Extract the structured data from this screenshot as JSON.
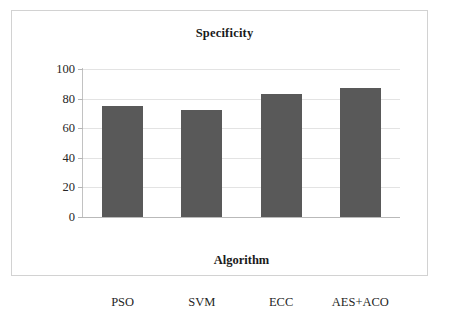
{
  "chart_data": {
    "type": "bar",
    "title": "Specificity",
    "xlabel": "Algorithm",
    "ylabel": "Percentage",
    "categories": [
      "PSO",
      "SVM",
      "ECC",
      "AES+ACO"
    ],
    "values": [
      75,
      72,
      83,
      87
    ],
    "ylim": [
      0,
      100
    ],
    "yticks": [
      0,
      20,
      40,
      60,
      80,
      100
    ],
    "ytick_labels": [
      "0",
      "20",
      "40",
      "60",
      "80",
      "100"
    ],
    "grid": true,
    "legend": false,
    "bar_color": "#595959",
    "gridline_color": "#e3e3e3",
    "axis_color": "#b9b9b9",
    "frame_color": "#d2d2d2",
    "background_color": "#ffffff",
    "series": [
      {
        "name": "Specificity",
        "values": [
          75,
          72,
          83,
          87
        ]
      }
    ]
  }
}
